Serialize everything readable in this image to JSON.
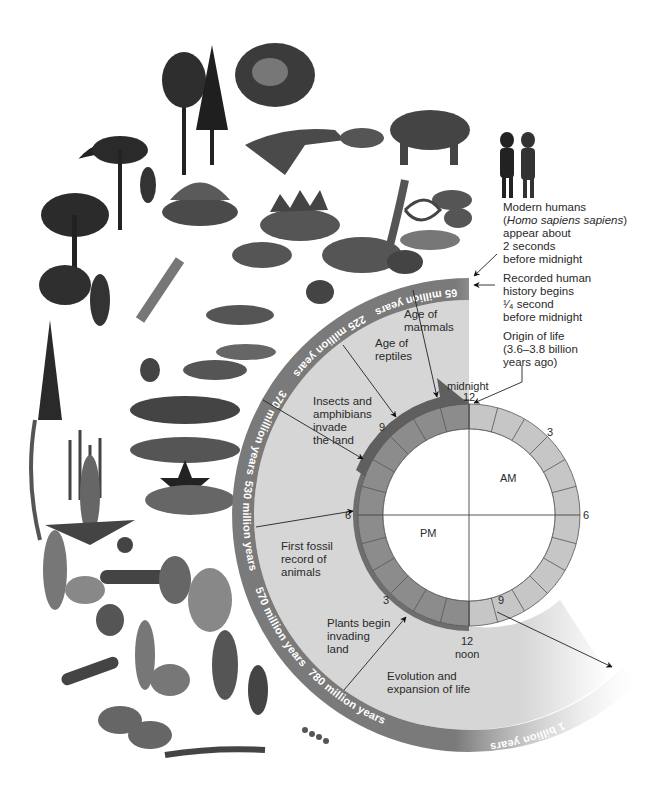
{
  "figure": {
    "clock": {
      "hour_labels": {
        "top": "12",
        "top_caption": "midnight",
        "right": "6",
        "left": "6",
        "upper_right": "3",
        "lower_right": "9",
        "upper_left": "9",
        "lower_left": "3",
        "bottom": "12",
        "bottom_caption": "noon"
      },
      "halves": {
        "am": "AM",
        "pm": "PM"
      },
      "segments": 24
    },
    "timeline_band": [
      {
        "label": "65 million years"
      },
      {
        "label": "225 million years"
      },
      {
        "label": "370 million years"
      },
      {
        "label": "530 million years"
      },
      {
        "label": "570 million years"
      },
      {
        "label": "780 million years"
      },
      {
        "label": "1 billion years"
      }
    ],
    "events": {
      "age_of_mammals": "Age of\nmammals",
      "age_of_reptiles": "Age of\nreptiles",
      "insects_amphibians": "Insects and\namphibians\ninvade\nthe land",
      "first_fossil": "First fossil\nrecord of\nanimals",
      "plants": "Plants begin\ninvading\nland",
      "evolution": "Evolution and\nexpansion of life"
    },
    "annotations": {
      "modern_humans_line1": "Modern humans",
      "modern_humans_species": "Homo sapiens sapiens",
      "modern_humans_rest": "appear about\n2 seconds\nbefore midnight",
      "recorded_history": "Recorded human\nhistory begins\n¹⁄₄ second\nbefore midnight",
      "origin_of_life": "Origin of life\n(3.6–3.8 billion\nyears ago)"
    },
    "colors": {
      "band": "#7a7a7a",
      "fill": "#d6d6d6",
      "clock_am": "#c6c6c6",
      "clock_pm": "#8c8c8c",
      "pm_arrow": "#6e6e6e"
    },
    "illustration": {
      "description": "Procession of organisms from early life (algae, jellyfish, trilobites) through fishes, amphibians, insects, dinosaurs, mammals and modern humans"
    }
  }
}
